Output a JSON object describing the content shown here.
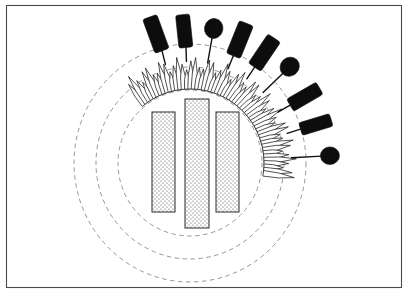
{
  "figure": {
    "canvas": {
      "width": 408,
      "height": 293,
      "background": "#ffffff"
    },
    "frame": {
      "x": 6,
      "y": 5,
      "width": 396,
      "height": 283,
      "stroke": "#4a4a4a",
      "stroke_width": 1.1
    },
    "center": {
      "cx": 190,
      "cy": 163
    },
    "dashed_circles": {
      "stroke": "#8a8a8a",
      "dash": "4.5 3.5",
      "stroke_width": 0.9,
      "rings": [
        {
          "name": "inner-ring",
          "rx": 72,
          "ry": 73
        },
        {
          "name": "middle-ring",
          "rx": 94,
          "ry": 96
        },
        {
          "name": "outer-ring",
          "rx": 116,
          "ry": 119
        }
      ]
    },
    "bars": {
      "fill_color": "#fdfdfd",
      "stroke": "#2a2a2a",
      "stipple": "dotted-stipple",
      "items": [
        {
          "name": "left-bar",
          "x": 152,
          "y": 112,
          "width": 23,
          "height": 100
        },
        {
          "name": "center-bar",
          "x": 185,
          "y": 99,
          "width": 24,
          "height": 129
        },
        {
          "name": "right-bar",
          "x": 216,
          "y": 112,
          "width": 23,
          "height": 100
        }
      ]
    },
    "bristles": {
      "name": "radiating-bristle-array",
      "count": 54,
      "angle_start_deg": -128,
      "angle_end_deg": 8,
      "inner_radius": 74,
      "length": 30,
      "width": 5.6,
      "fill": "#ffffff",
      "stroke": "#1a1a1a"
    },
    "appendages": {
      "stalk_color": "#111111",
      "head_color": "#0d0d0d",
      "items": [
        {
          "name": "club-1",
          "type": "club",
          "angle_deg": -104,
          "stalk_len": 14,
          "head_len": 36,
          "head_w": 15,
          "head_tilt": -6
        },
        {
          "name": "club-2",
          "type": "club",
          "angle_deg": -92,
          "stalk_len": 14,
          "head_len": 33,
          "head_w": 14,
          "head_tilt": -4
        },
        {
          "name": "blob-1",
          "type": "blob",
          "angle_deg": -80,
          "stalk_len": 26,
          "head_r": 10
        },
        {
          "name": "club-3",
          "type": "club",
          "angle_deg": -68,
          "stalk_len": 14,
          "head_len": 35,
          "head_w": 15,
          "head_tilt": 0
        },
        {
          "name": "club-4",
          "type": "club",
          "angle_deg": -56,
          "stalk_len": 14,
          "head_len": 35,
          "head_w": 15,
          "head_tilt": 0
        },
        {
          "name": "blob-2",
          "type": "blob",
          "angle_deg": -44,
          "stalk_len": 28,
          "head_r": 10
        },
        {
          "name": "club-5",
          "type": "club",
          "angle_deg": -30,
          "stalk_len": 14,
          "head_len": 34,
          "head_w": 14,
          "head_tilt": 0
        },
        {
          "name": "club-6",
          "type": "club",
          "angle_deg": -17,
          "stalk_len": 14,
          "head_len": 32,
          "head_w": 13,
          "head_tilt": 0
        },
        {
          "name": "blob-3",
          "type": "blob",
          "angle_deg": -3,
          "stalk_len": 30,
          "head_r": 9.5
        }
      ]
    }
  }
}
